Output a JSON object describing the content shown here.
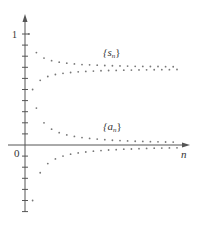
{
  "chart_data": {
    "type": "scatter",
    "title": "",
    "xlabel": "n",
    "ylabel": "",
    "origin_label": "0",
    "y_tick_label": "1",
    "ylim": [
      -0.6,
      1.1
    ],
    "xlim": [
      0,
      42
    ],
    "y_tick_step": 0.1,
    "grid": false,
    "annotations": [
      {
        "text": "{s_n}",
        "near_series": "s_n"
      },
      {
        "text": "{a_n}",
        "near_series": "a_n"
      }
    ],
    "series": [
      {
        "name": "a_n",
        "description": "a_n = (-1)^(n-1)/n",
        "x": [
          1,
          2,
          3,
          4,
          5,
          6,
          7,
          8,
          9,
          10,
          11,
          12,
          13,
          14,
          15,
          16,
          17,
          18,
          19,
          20,
          21,
          22,
          23,
          24,
          25,
          26,
          27,
          28,
          29,
          30,
          31,
          32,
          33,
          34,
          35,
          36,
          37,
          38,
          39,
          40
        ],
        "values": [
          1.0,
          -0.5,
          0.333,
          -0.25,
          0.2,
          -0.167,
          0.143,
          -0.125,
          0.111,
          -0.1,
          0.091,
          -0.083,
          0.077,
          -0.071,
          0.067,
          -0.063,
          0.059,
          -0.056,
          0.053,
          -0.05,
          0.048,
          -0.045,
          0.043,
          -0.042,
          0.04,
          -0.038,
          0.037,
          -0.036,
          0.034,
          -0.033,
          0.032,
          -0.031,
          0.03,
          -0.029,
          0.029,
          -0.028,
          0.027,
          -0.026,
          0.026,
          -0.025
        ]
      },
      {
        "name": "s_n",
        "description": "partial sums s_n of a_n, converging to ~0.69",
        "x": [
          1,
          2,
          3,
          4,
          5,
          6,
          7,
          8,
          9,
          10,
          11,
          12,
          13,
          14,
          15,
          16,
          17,
          18,
          19,
          20,
          21,
          22,
          23,
          24,
          25,
          26,
          27,
          28,
          29,
          30,
          31,
          32,
          33,
          34,
          35,
          36,
          37,
          38,
          39,
          40
        ],
        "values": [
          1.0,
          0.5,
          0.833,
          0.583,
          0.783,
          0.617,
          0.76,
          0.635,
          0.746,
          0.646,
          0.737,
          0.653,
          0.73,
          0.659,
          0.725,
          0.663,
          0.722,
          0.666,
          0.719,
          0.669,
          0.716,
          0.671,
          0.714,
          0.672,
          0.712,
          0.674,
          0.711,
          0.675,
          0.709,
          0.676,
          0.708,
          0.677,
          0.707,
          0.678,
          0.707,
          0.679,
          0.706,
          0.679,
          0.705,
          0.68
        ]
      }
    ]
  },
  "labels": {
    "s_series": "{s",
    "s_sub": "n",
    "a_series": "{a",
    "a_sub": "n",
    "close": "}",
    "x_axis": "n",
    "origin": "0",
    "y_one": "1"
  },
  "colors": {
    "axis": "#555555",
    "points": "#777777",
    "text": "#333333"
  }
}
